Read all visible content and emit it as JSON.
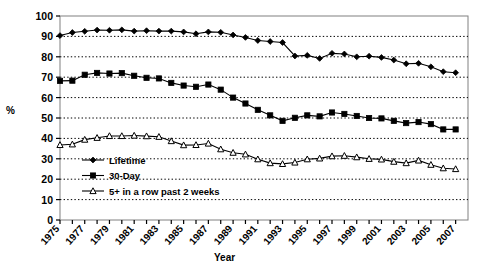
{
  "chart_data": {
    "type": "line",
    "title": "",
    "xlabel": "Year",
    "ylabel": "%",
    "xlim": [
      1975,
      2008
    ],
    "ylim": [
      0,
      100
    ],
    "ytick_step": 10,
    "yticks": [
      0,
      10,
      20,
      30,
      40,
      50,
      60,
      70,
      80,
      90,
      100
    ],
    "xticks": [
      1975,
      1976,
      1977,
      1978,
      1979,
      1980,
      1981,
      1982,
      1983,
      1984,
      1985,
      1986,
      1987,
      1988,
      1989,
      1990,
      1991,
      1992,
      1993,
      1994,
      1995,
      1996,
      1997,
      1998,
      1999,
      2000,
      2001,
      2002,
      2003,
      2004,
      2005,
      2006,
      2007
    ],
    "xtick_labels": [
      "1975",
      "",
      "1977",
      "",
      "1979",
      "",
      "1981",
      "",
      "1983",
      "",
      "1985",
      "",
      "1987",
      "",
      "1989",
      "",
      "1991",
      "",
      "1993",
      "",
      "1995",
      "",
      "1997",
      "",
      "1999",
      "",
      "2001",
      "",
      "2003",
      "",
      "2005",
      "",
      "2007"
    ],
    "grid": "horizontal-dotted",
    "legend_position": "inside-lower-left",
    "x": [
      1975,
      1976,
      1977,
      1978,
      1979,
      1980,
      1981,
      1982,
      1983,
      1984,
      1985,
      1986,
      1987,
      1988,
      1989,
      1990,
      1991,
      1992,
      1993,
      1994,
      1995,
      1996,
      1997,
      1998,
      1999,
      2000,
      2001,
      2002,
      2003,
      2004,
      2005,
      2006,
      2007
    ],
    "series": [
      {
        "name": "Lifetime",
        "marker": "diamond",
        "marker_fill": "filled",
        "color": "#000000",
        "values": [
          90.4,
          91.9,
          92.5,
          93.1,
          93.0,
          93.2,
          92.6,
          92.8,
          92.6,
          92.6,
          92.2,
          91.3,
          92.2,
          92.0,
          90.7,
          89.5,
          88.0,
          87.5,
          87.0,
          80.4,
          80.7,
          79.2,
          81.7,
          81.4,
          80.0,
          80.3,
          79.7,
          78.4,
          76.6,
          76.8,
          75.1,
          72.7,
          72.2
        ]
      },
      {
        "name": "30-Day",
        "marker": "square",
        "marker_fill": "filled",
        "color": "#000000",
        "values": [
          68.2,
          68.3,
          71.2,
          72.1,
          71.8,
          72.0,
          70.7,
          69.7,
          69.4,
          67.2,
          65.9,
          65.3,
          66.4,
          63.9,
          60.0,
          57.1,
          54.0,
          51.3,
          48.6,
          50.1,
          51.3,
          50.8,
          52.7,
          52.0,
          51.0,
          50.0,
          49.8,
          48.6,
          47.5,
          48.0,
          47.0,
          44.4,
          44.4
        ]
      },
      {
        "name": "5+ in a row past 2 weeks",
        "marker": "triangle",
        "marker_fill": "open",
        "color": "#000000",
        "values": [
          36.8,
          37.1,
          39.4,
          40.3,
          41.2,
          41.2,
          41.4,
          41.1,
          40.8,
          38.7,
          36.7,
          36.8,
          37.5,
          34.7,
          33.0,
          32.2,
          29.8,
          27.9,
          27.5,
          28.2,
          29.8,
          30.2,
          31.3,
          31.5,
          30.8,
          30.0,
          29.7,
          28.6,
          27.9,
          29.2,
          27.1,
          25.4,
          25.0
        ]
      }
    ]
  },
  "legend": {
    "items": [
      {
        "label": "Lifetime"
      },
      {
        "label": "30-Day"
      },
      {
        "label": "5+ in a row past 2 weeks"
      }
    ]
  }
}
